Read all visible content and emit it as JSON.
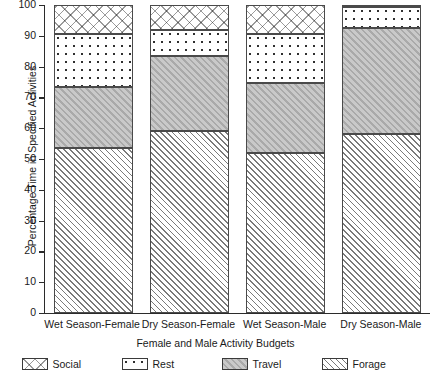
{
  "chart_data": {
    "type": "bar",
    "subtype": "stacked-bar",
    "title": "",
    "xlabel": "Female and Male Activity Budgets",
    "ylabel": "Percentage Time in Specified Activities",
    "ylim": [
      0,
      100
    ],
    "yticks": [
      0,
      10,
      20,
      30,
      40,
      50,
      60,
      70,
      80,
      90,
      100
    ],
    "grid": false,
    "legend_position": "bottom",
    "categories": [
      "Wet Season-Female",
      "Dry Season-Female",
      "Wet Season-Male",
      "Dry Season-Male"
    ],
    "series": [
      {
        "name": "Forage",
        "pattern": "diagonal-hatch",
        "values": [
          53.5,
          59.0,
          52.0,
          58.0
        ]
      },
      {
        "name": "Travel",
        "pattern": "solid-gray",
        "values": [
          20.0,
          24.5,
          22.7,
          34.5
        ]
      },
      {
        "name": "Rest",
        "pattern": "dots",
        "values": [
          17.1,
          8.5,
          16.0,
          6.8
        ]
      },
      {
        "name": "Social",
        "pattern": "cross-hatch",
        "values": [
          9.4,
          8.0,
          9.3,
          0.7
        ]
      }
    ],
    "cumulative_tops": {
      "Forage": [
        53.5,
        59.0,
        52.0,
        58.0
      ],
      "Travel": [
        73.5,
        83.5,
        74.7,
        92.5
      ],
      "Rest": [
        90.6,
        92.0,
        90.7,
        99.3
      ],
      "Social": [
        100.0,
        100.0,
        100.0,
        100.0
      ]
    },
    "colors": {
      "axis": "#2b2b2b",
      "travel_fill": "#b4b4b4",
      "hatch_line": "#7a7a7a",
      "dot": "#2f2f2f"
    }
  },
  "axes": {
    "y_title": "Percentage Time in Specified Activities",
    "x_title": "Female and Male Activity Budgets",
    "y_tick_labels": [
      "100",
      "90",
      "80",
      "70",
      "60",
      "50",
      "40",
      "30",
      "20",
      "10",
      "0"
    ]
  },
  "legend": {
    "items": [
      {
        "label": "Social"
      },
      {
        "label": "Rest"
      },
      {
        "label": "Travel"
      },
      {
        "label": "Forage"
      }
    ]
  }
}
